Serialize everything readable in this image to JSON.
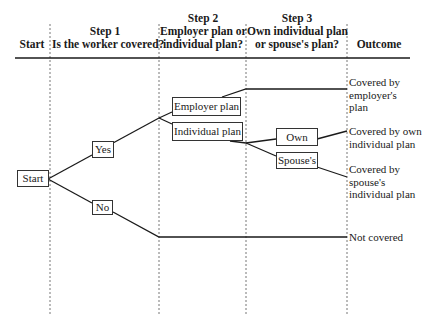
{
  "headers": {
    "start": "Start",
    "step1": {
      "title": "Step 1",
      "question": "Is  the worker covered?"
    },
    "step2": {
      "title": "Step 2",
      "question_line1": "Employer plan or",
      "question_line2": "individual plan?"
    },
    "step3": {
      "title": "Step 3",
      "question_line1": "Own individual plan",
      "question_line2": "or spouse's  plan?"
    },
    "outcome": "Outcome"
  },
  "nodes": {
    "start": "Start",
    "yes": "Yes",
    "no": "No",
    "employer_plan": "Employer plan",
    "individual_plan": "Individual plan",
    "own": "Own",
    "spouses": "Spouse's"
  },
  "outcomes": {
    "employer": [
      "Covered by",
      "employer's",
      "plan"
    ],
    "own": [
      "Covered by own",
      "individual plan"
    ],
    "spouse": [
      "Covered by",
      "spouse's",
      "individual plan"
    ],
    "not_covered": [
      "Not covered"
    ]
  },
  "colors": {
    "line": "#1a1a1a",
    "divider": "#777777"
  }
}
